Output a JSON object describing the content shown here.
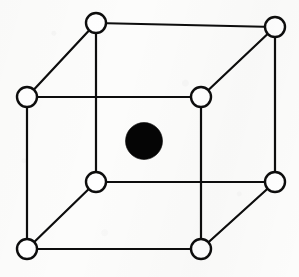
{
  "figure": {
    "background_color": "#fcfcfb",
    "line_color": "#0d0d0d",
    "corner_atom_fill": "#ffffff",
    "center_atom_fill": "#050505",
    "edge_stroke_width": 2.2,
    "corner_atom_radius": 10,
    "center_atom_radius": 18.5,
    "width": 299,
    "height": 277
  },
  "chart_data": {
    "type": "diagram",
    "diagram_kind": "crystal-lattice-unit-cell",
    "lattice": "body-centered cubic (BCC)",
    "xlabel": "",
    "ylabel": "",
    "projection": "oblique / cabinet",
    "atom_count_total": 9,
    "corner_atom_count": 8,
    "center_atom_count": 1,
    "atoms": [
      {
        "id": "corner-back-top-left",
        "x": 96,
        "y": 23,
        "r": 10,
        "fill": "#ffffff",
        "role": "corner"
      },
      {
        "id": "corner-back-top-right",
        "x": 275,
        "y": 27,
        "r": 10,
        "fill": "#ffffff",
        "role": "corner"
      },
      {
        "id": "corner-front-top-left",
        "x": 27,
        "y": 97,
        "r": 10,
        "fill": "#ffffff",
        "role": "corner"
      },
      {
        "id": "corner-front-top-right",
        "x": 201,
        "y": 97,
        "r": 10,
        "fill": "#ffffff",
        "role": "corner"
      },
      {
        "id": "corner-back-bottom-left",
        "x": 96,
        "y": 182,
        "r": 10,
        "fill": "#ffffff",
        "role": "corner"
      },
      {
        "id": "corner-back-bottom-right",
        "x": 275,
        "y": 182,
        "r": 10,
        "fill": "#ffffff",
        "role": "corner"
      },
      {
        "id": "corner-front-bottom-left",
        "x": 27,
        "y": 249,
        "r": 10,
        "fill": "#ffffff",
        "role": "corner"
      },
      {
        "id": "corner-front-bottom-right",
        "x": 201,
        "y": 249,
        "r": 10,
        "fill": "#ffffff",
        "role": "corner"
      },
      {
        "id": "body-center",
        "x": 144,
        "y": 141,
        "r": 18.5,
        "fill": "#050505",
        "role": "body-center"
      }
    ],
    "edges": [
      {
        "id": "edge-back-top",
        "from": "corner-back-top-left",
        "to": "corner-back-top-right"
      },
      {
        "id": "edge-back-left",
        "from": "corner-back-top-left",
        "to": "corner-back-bottom-left"
      },
      {
        "id": "edge-back-right",
        "from": "corner-back-top-right",
        "to": "corner-back-bottom-right"
      },
      {
        "id": "edge-back-bottom",
        "from": "corner-back-bottom-left",
        "to": "corner-back-bottom-right"
      },
      {
        "id": "edge-front-top",
        "from": "corner-front-top-left",
        "to": "corner-front-top-right"
      },
      {
        "id": "edge-front-left",
        "from": "corner-front-top-left",
        "to": "corner-front-bottom-left"
      },
      {
        "id": "edge-front-right",
        "from": "corner-front-top-right",
        "to": "corner-front-bottom-right"
      },
      {
        "id": "edge-front-bottom",
        "from": "corner-front-bottom-left",
        "to": "corner-front-bottom-right"
      },
      {
        "id": "edge-depth-top-left",
        "from": "corner-front-top-left",
        "to": "corner-back-top-left"
      },
      {
        "id": "edge-depth-top-right",
        "from": "corner-front-top-right",
        "to": "corner-back-top-right"
      },
      {
        "id": "edge-depth-bottom-left",
        "from": "corner-front-bottom-left",
        "to": "corner-back-bottom-left"
      },
      {
        "id": "edge-depth-bottom-right",
        "from": "corner-front-bottom-right",
        "to": "corner-back-bottom-right"
      }
    ],
    "annotations": [],
    "legend": []
  }
}
